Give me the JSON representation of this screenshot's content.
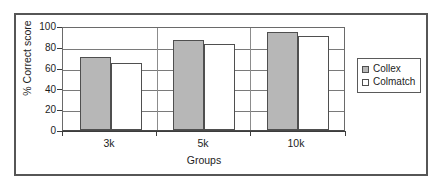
{
  "chart_data": {
    "type": "bar",
    "title": "",
    "xlabel": "Groups",
    "ylabel": "% Correct score",
    "categories": [
      "3k",
      "5k",
      "10k"
    ],
    "series": [
      {
        "name": "Collex",
        "values": [
          72,
          88,
          96
        ],
        "color": "#b7b7b7"
      },
      {
        "name": "Colmatch",
        "values": [
          66,
          84,
          92
        ],
        "color": "#ffffff"
      }
    ],
    "ylim": [
      0,
      100
    ],
    "ytick_labels": [
      "0",
      "20",
      "40",
      "60",
      "80",
      "100"
    ],
    "ytick_values": [
      0,
      20,
      40,
      60,
      80,
      100
    ],
    "grid": "horizontal",
    "legend_position": "right",
    "legend_entries": [
      "Collex",
      "Colmatch"
    ]
  },
  "frame": {
    "border_color": "#565656",
    "background": "#ffffff"
  }
}
